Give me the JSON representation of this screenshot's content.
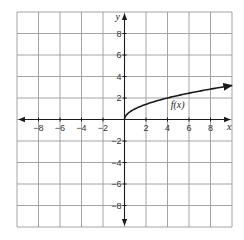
{
  "chart_data": {
    "type": "line",
    "title": "",
    "function_label": "f(x)",
    "xlabel": "x",
    "ylabel": "y",
    "xlim": [
      -10,
      10
    ],
    "ylim": [
      -10,
      10
    ],
    "grid": true,
    "grid_step": 2,
    "x_ticks": [
      -8,
      -6,
      -4,
      -2,
      2,
      4,
      6,
      8
    ],
    "y_ticks": [
      8,
      6,
      4,
      2,
      -2,
      -4,
      -6,
      -8
    ],
    "series": [
      {
        "name": "f(x)",
        "x": [
          0,
          0.25,
          0.5,
          1,
          2,
          3,
          4,
          5,
          6,
          7,
          8,
          9,
          10
        ],
        "values": [
          0,
          0.5,
          0.71,
          1,
          1.41,
          1.73,
          2,
          2.24,
          2.45,
          2.65,
          2.83,
          3,
          3.16
        ],
        "arrow_end": true
      }
    ],
    "colors": {
      "grid": "#9a9a9a",
      "axes": "#1a1a1a",
      "curve": "#1a1a1a"
    }
  }
}
